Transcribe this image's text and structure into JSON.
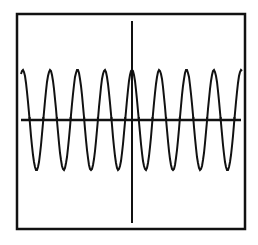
{
  "window": {
    "width": 258,
    "height": 245,
    "frame": {
      "left": 17,
      "top": 14,
      "right": 245,
      "bottom": 229
    },
    "colors": {
      "ink": "#111111",
      "background": "#ffffff"
    }
  },
  "chart_data": {
    "type": "line",
    "title": "",
    "xlabel": "",
    "ylabel": "",
    "grid": false,
    "legend": "none",
    "series": [
      {
        "name": "y = A*cos(k*x)",
        "function": "cosine",
        "amplitude_px": 50,
        "period_px": 27.3,
        "phase_peak_x_px": 132,
        "baseline_y_px": 120,
        "x_start_px": 21,
        "x_end_px": 242,
        "peaks_x_px": [
          22,
          49,
          77,
          104,
          132,
          159,
          186,
          213,
          240
        ],
        "troughs_x_px": [
          35,
          62,
          90,
          118,
          145,
          173,
          200,
          228
        ],
        "peak_y_px": 71,
        "trough_y_px": 172
      }
    ],
    "axes": {
      "x_axis": {
        "y_px": 120,
        "x_from_px": 21,
        "x_to_px": 241,
        "tick_marks": "at zero crossings"
      },
      "y_axis": {
        "x_px": 132,
        "y_from_px": 21,
        "y_to_px": 223
      }
    },
    "cycles_visible": 8
  }
}
